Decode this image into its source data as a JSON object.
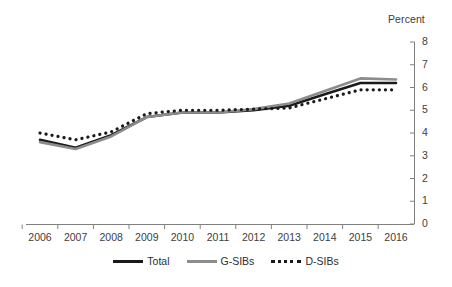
{
  "unit_label": "Percent",
  "legend": {
    "position": "bottom-center",
    "entries": [
      {
        "label": "Total",
        "style": "solid",
        "color": "#1a1a1a",
        "icon": "solid-line-icon"
      },
      {
        "label": "G-SIBs",
        "style": "solid",
        "color": "#8c8c8c",
        "icon": "solid-line-icon"
      },
      {
        "label": "D-SIBs",
        "style": "dotted",
        "color": "#1a1a1a",
        "icon": "dotted-line-icon"
      }
    ]
  },
  "axis": {
    "y_ticks": [
      "0",
      "1",
      "2",
      "3",
      "4",
      "5",
      "6",
      "7",
      "8"
    ],
    "x_ticks": [
      "2006",
      "2007",
      "2008",
      "2009",
      "2010",
      "2011",
      "2012",
      "2013",
      "2014",
      "2015",
      "2016"
    ]
  },
  "chart_data": {
    "type": "line",
    "title": "",
    "subtitle": "",
    "xlabel": "",
    "ylabel": "Percent",
    "ylim": [
      0,
      8
    ],
    "ytick_interval": 1,
    "grid": false,
    "y_axis_side": "right",
    "legend_position": "bottom-center",
    "categories": [
      "2006",
      "2007",
      "2008",
      "2009",
      "2010",
      "2011",
      "2012",
      "2013",
      "2014",
      "2015",
      "2016"
    ],
    "x": [
      2006,
      2007,
      2008,
      2009,
      2010,
      2011,
      2012,
      2013,
      2014,
      2015,
      2016
    ],
    "series": [
      {
        "name": "Total",
        "style": "solid",
        "color": "#1a1a1a",
        "values": [
          3.7,
          3.35,
          3.9,
          4.7,
          4.9,
          4.9,
          5.0,
          5.2,
          5.7,
          6.2,
          6.2
        ]
      },
      {
        "name": "G-SIBs",
        "style": "solid",
        "color": "#8c8c8c",
        "values": [
          3.6,
          3.3,
          3.85,
          4.7,
          4.9,
          4.9,
          5.05,
          5.3,
          5.85,
          6.4,
          6.35
        ]
      },
      {
        "name": "D-SIBs",
        "style": "dotted",
        "color": "#1a1a1a",
        "values": [
          4.0,
          3.7,
          4.05,
          4.85,
          5.0,
          5.0,
          5.05,
          5.1,
          5.5,
          5.9,
          5.9
        ]
      }
    ]
  }
}
